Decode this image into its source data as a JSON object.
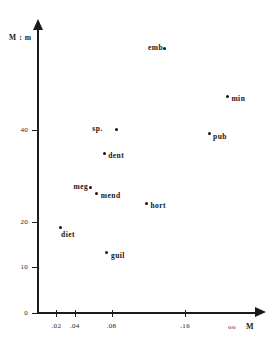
{
  "chart_data": {
    "type": "scatter",
    "title": "",
    "xlabel": "M",
    "ylabel": "M : m",
    "xlim": [
      0,
      0.236
    ],
    "ylim": [
      0,
      62
    ],
    "grid": false,
    "legend": "none",
    "x_ticks": [
      ".02",
      ".04",
      ".08",
      ".16"
    ],
    "x_tick_values": [
      0.02,
      0.04,
      0.08,
      0.16
    ],
    "y_ticks": [
      "0",
      "10",
      "20",
      "40"
    ],
    "y_tick_values": [
      0,
      10,
      20,
      40
    ],
    "x_axis_end_label": "oo",
    "points": [
      {
        "label": "emb",
        "x": 0.138,
        "y": 58.0,
        "label_side": "left"
      },
      {
        "label": "min",
        "x": 0.206,
        "y": 47.5,
        "label_side": "right"
      },
      {
        "label": "sp.",
        "x": 0.085,
        "y": 40.2,
        "label_side": "left-far"
      },
      {
        "label": "pub",
        "x": 0.186,
        "y": 39.3,
        "label_side": "right"
      },
      {
        "label": "dent",
        "x": 0.072,
        "y": 35.0,
        "label_side": "right"
      },
      {
        "label": "meg",
        "x": 0.057,
        "y": 27.5,
        "label_side": "left"
      },
      {
        "label": "mend",
        "x": 0.064,
        "y": 26.2,
        "label_side": "right"
      },
      {
        "label": "hort",
        "x": 0.118,
        "y": 24.0,
        "label_side": "right"
      },
      {
        "label": "diet",
        "x": 0.024,
        "y": 18.7,
        "label_side": "below-right"
      },
      {
        "label": "guil",
        "x": 0.075,
        "y": 13.2,
        "label_side": "right"
      }
    ]
  },
  "axes": {
    "y_title": "M : m",
    "x_title": "M"
  }
}
